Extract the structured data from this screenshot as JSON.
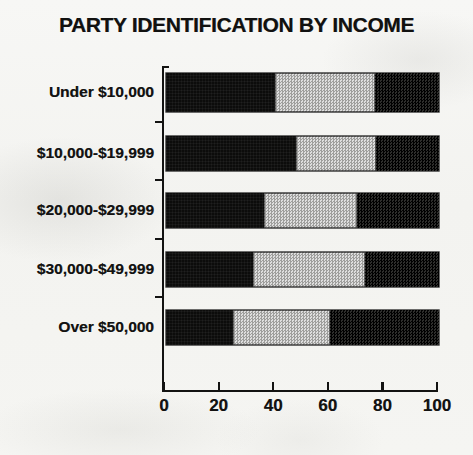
{
  "chart_data": {
    "type": "bar",
    "orientation": "horizontal",
    "stacked": true,
    "title": "PARTY IDENTIFICATION BY INCOME",
    "xlabel": "",
    "ylabel": "",
    "xlim": [
      0,
      100
    ],
    "ylim": null,
    "grid": false,
    "legend": null,
    "xticks": [
      "0",
      "20",
      "40",
      "60",
      "80",
      "100"
    ],
    "xtick_values": [
      0,
      20,
      40,
      60,
      80,
      100
    ],
    "categories": [
      "Under $10,000",
      "$10,000-$19,999",
      "$20,000-$29,999",
      "$30,000-$49,999",
      "Over $50,000"
    ],
    "series": [
      {
        "name": "segment-1-black",
        "color": "#0c0c0b",
        "values": [
          40,
          47.5,
          36,
          32,
          24.5
        ]
      },
      {
        "name": "segment-2-light-gray",
        "color": "#c3c3c1",
        "values": [
          36.5,
          29.5,
          34,
          41,
          35.5
        ]
      },
      {
        "name": "segment-3-dark",
        "color": "#191918",
        "values": [
          23.5,
          23,
          30,
          27,
          40
        ]
      }
    ]
  },
  "colors": {
    "background": "#f4f4f1",
    "ink": "#121211",
    "segment_black": "#0c0c0b",
    "segment_gray": "#c3c3c1",
    "segment_dark": "#191918"
  }
}
